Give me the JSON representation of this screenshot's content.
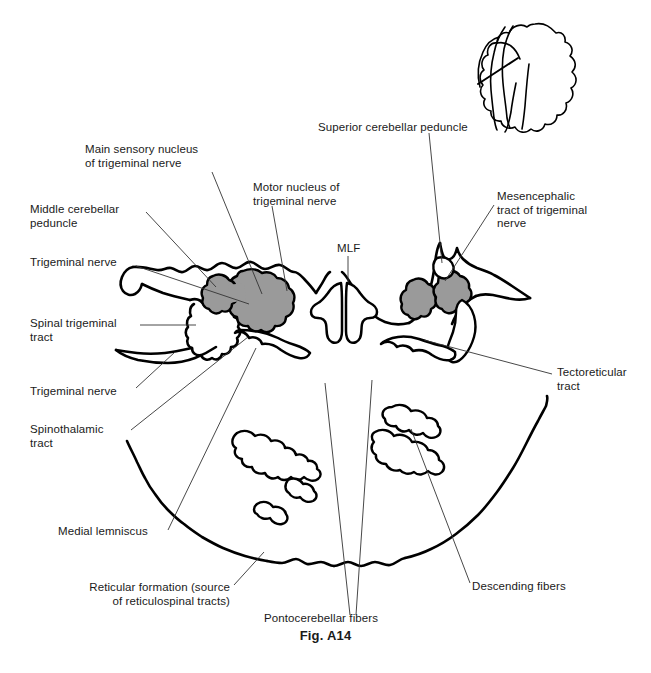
{
  "figure": {
    "caption": "Fig. A14",
    "caption_x": 0,
    "caption_y": 628,
    "outline_color": "#000000",
    "nucleus_fill_color": "#9a9a9a",
    "leader_color": "#333333",
    "background": "#ffffff"
  },
  "labels": [
    {
      "id": "main-sensory-nucleus",
      "text": "Main sensory nucleus\nof trigeminal nerve",
      "x": 85,
      "y": 143,
      "width": 120,
      "align": "left"
    },
    {
      "id": "middle-cerebellar-peduncle",
      "text": "Middle cerebellar\npeduncle",
      "x": 30,
      "y": 203,
      "width": 110,
      "align": "left"
    },
    {
      "id": "trigeminal-nerve-upper",
      "text": "Trigeminal nerve",
      "x": 30,
      "y": 256,
      "width": 100,
      "align": "left"
    },
    {
      "id": "spinal-trigeminal-tract",
      "text": "Spinal trigeminal\ntract",
      "x": 30,
      "y": 317,
      "width": 105,
      "align": "left"
    },
    {
      "id": "trigeminal-nerve-lower",
      "text": "Trigeminal nerve",
      "x": 30,
      "y": 385,
      "width": 100,
      "align": "left"
    },
    {
      "id": "spinothalamic-tract",
      "text": "Spinothalamic\ntract",
      "x": 30,
      "y": 423,
      "width": 95,
      "align": "left"
    },
    {
      "id": "medial-lemniscus",
      "text": "Medial lemniscus",
      "x": 58,
      "y": 525,
      "width": 105,
      "align": "left"
    },
    {
      "id": "reticular-formation",
      "text": "Reticular formation (source\nof reticulospinal tracts)",
      "x": 78,
      "y": 581,
      "width": 150,
      "align": "right"
    },
    {
      "id": "motor-nucleus",
      "text": "Motor nucleus of\ntrigeminal nerve",
      "x": 253,
      "y": 181,
      "width": 105,
      "align": "left"
    },
    {
      "id": "mlf",
      "text": "MLF",
      "x": 337,
      "y": 242,
      "width": 40,
      "align": "left"
    },
    {
      "id": "superior-cerebellar-peduncle",
      "text": "Superior cerebellar peduncle",
      "x": 318,
      "y": 121,
      "width": 160,
      "align": "left"
    },
    {
      "id": "mesencephalic-tract",
      "text": "Mesencephalic\ntract of trigeminal\nnerve",
      "x": 497,
      "y": 190,
      "width": 110,
      "align": "left"
    },
    {
      "id": "tectoreticular-tract",
      "text": "Tectoreticular\ntract",
      "x": 557,
      "y": 366,
      "width": 90,
      "align": "left"
    },
    {
      "id": "descending-fibers",
      "text": "Descending fibers",
      "x": 472,
      "y": 580,
      "width": 105,
      "align": "left"
    },
    {
      "id": "pontocerebellar-fibers",
      "text": "Pontocerebellar fibers",
      "x": 264,
      "y": 612,
      "width": 130,
      "align": "left"
    }
  ],
  "leader_lines": [
    {
      "id": "leader-main-sensory-nucleus",
      "points": "212,172 262,294"
    },
    {
      "id": "leader-middle-cerebellar-peduncle",
      "points": "146,212 216,287"
    },
    {
      "id": "leader-trigeminal-nerve-upper",
      "points": "136,266 249,304"
    },
    {
      "id": "leader-spinal-trigeminal-tract",
      "points": "140,325 196,325"
    },
    {
      "id": "leader-trigeminal-nerve-lower",
      "points": "136,388 175,352"
    },
    {
      "id": "leader-spinothalamic-tract",
      "points": "131,430 248,337"
    },
    {
      "id": "leader-medial-lemniscus",
      "points": "168,530 256,348"
    },
    {
      "id": "leader-reticular-formation",
      "points": "234,585 264,552"
    },
    {
      "id": "leader-motor-nucleus",
      "points": "272,206 287,291"
    },
    {
      "id": "leader-mlf",
      "points": "348,256 348,282"
    },
    {
      "id": "leader-superior-cerebellar-peduncle",
      "points": "429,133 442,263"
    },
    {
      "id": "leader-mesencephalic-tract",
      "points": "494,205 445,281"
    },
    {
      "id": "leader-tectoreticular-tract",
      "points": "552,374 424,340"
    },
    {
      "id": "leader-descending-fibers",
      "points": "470,583 411,429"
    },
    {
      "id": "leader-pontocerebellar-left",
      "points": "350,615 325,383"
    },
    {
      "id": "leader-pontocerebellar-right",
      "points": "356,615 372,380"
    }
  ],
  "structures": [
    {
      "id": "brainstem-outline",
      "name": "pons-cross-section-outline"
    },
    {
      "id": "mlf-left",
      "name": "medial-longitudinal-fasciculus-left"
    },
    {
      "id": "mlf-right",
      "name": "medial-longitudinal-fasciculus-right"
    },
    {
      "id": "main-sensory-nucleus-left",
      "name": "shaded-nucleus",
      "shaded": true
    },
    {
      "id": "motor-nucleus-left",
      "name": "shaded-nucleus",
      "shaded": true
    },
    {
      "id": "nucleus-right-medial",
      "name": "shaded-nucleus",
      "shaded": true
    },
    {
      "id": "nucleus-right-lateral",
      "name": "shaded-nucleus",
      "shaded": true
    },
    {
      "id": "spinal-trigeminal-tract-blob",
      "name": "tract-outline"
    },
    {
      "id": "tectoreticular-left",
      "name": "tract-outline"
    },
    {
      "id": "tectoreticular-right",
      "name": "tract-outline"
    },
    {
      "id": "pontocerebellar-left-upper",
      "name": "fiber-bundle-outline"
    },
    {
      "id": "pontocerebellar-left-mid",
      "name": "fiber-bundle-outline"
    },
    {
      "id": "pontocerebellar-left-lower",
      "name": "fiber-bundle-outline"
    },
    {
      "id": "pontocerebellar-right-upper",
      "name": "fiber-bundle-outline"
    },
    {
      "id": "pontocerebellar-right-lower",
      "name": "fiber-bundle-outline"
    }
  ],
  "inset": {
    "id": "orientation-inset",
    "name": "brainstem-cerebellum-orientation-inset",
    "x": 470,
    "y": 14,
    "width": 170,
    "height": 112
  }
}
